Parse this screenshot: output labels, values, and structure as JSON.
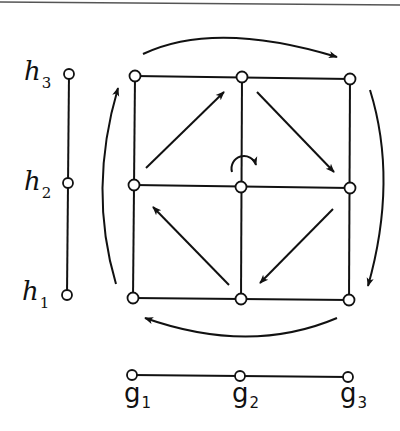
{
  "diagram": {
    "type": "product-graph-rotation",
    "colors": {
      "stroke": "#111111",
      "node_fill": "#ffffff",
      "background": "#ffffff",
      "top_rule": "#555555"
    },
    "h_axis": {
      "labels": [
        {
          "base": "h",
          "sub": "3"
        },
        {
          "base": "h",
          "sub": "2"
        },
        {
          "base": "h",
          "sub": "1"
        }
      ]
    },
    "g_axis": {
      "labels": [
        {
          "base": "g",
          "sub": "1"
        },
        {
          "base": "g",
          "sub": "2"
        },
        {
          "base": "g",
          "sub": "3"
        }
      ]
    },
    "grid": {
      "rows": 3,
      "cols": 3,
      "nodes": 9
    },
    "arrows": {
      "outer": [
        "top: left-to-right",
        "right: top-to-bottom",
        "bottom: right-to-left",
        "left: bottom-to-top"
      ],
      "inner": [
        "upper-left: toward top-middle",
        "upper-right: toward middle-right",
        "lower-right: toward bottom-middle",
        "lower-left: toward middle-left"
      ],
      "center": "clockwise rotation symbol"
    }
  }
}
